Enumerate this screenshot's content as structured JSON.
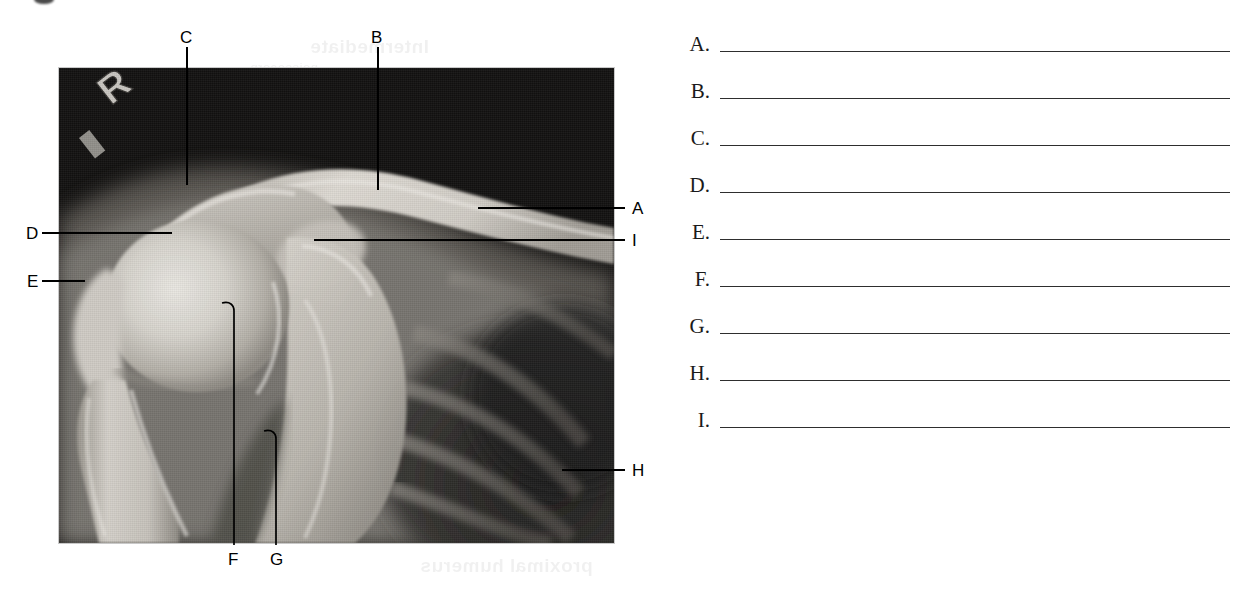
{
  "worksheet": {
    "type": "anatomy-labeling-exercise",
    "figure": {
      "kind": "radiograph",
      "region": "shoulder",
      "side_marker": "R",
      "marker_meaning": "right",
      "image_left": 59,
      "image_top": 68,
      "image_width": 555,
      "image_height": 475
    },
    "figure_labels": [
      {
        "letter": "A",
        "x": 632,
        "y": 208,
        "side": "right",
        "leader": {
          "type": "horizontal",
          "x1": 478,
          "y": 208,
          "x2": 625
        }
      },
      {
        "letter": "B",
        "x": 371,
        "y": 38,
        "side": "top",
        "leader": {
          "type": "vertical",
          "x": 377,
          "y1": 47,
          "y2": 190
        }
      },
      {
        "letter": "C",
        "x": 180,
        "y": 38,
        "side": "top",
        "leader": {
          "type": "vertical",
          "x": 186,
          "y1": 47,
          "y2": 185
        }
      },
      {
        "letter": "D",
        "x": 27,
        "y": 233,
        "side": "left",
        "leader": {
          "type": "horizontal",
          "x1": 42,
          "y": 233,
          "x2": 172
        }
      },
      {
        "letter": "E",
        "x": 27,
        "y": 281,
        "side": "left",
        "leader": {
          "type": "horizontal",
          "x1": 42,
          "y": 281,
          "x2": 85
        }
      },
      {
        "letter": "F",
        "x": 228,
        "y": 558,
        "side": "bottom",
        "leader": {
          "type": "vertical-hook",
          "x": 234,
          "y1": 303,
          "y2": 545
        }
      },
      {
        "letter": "G",
        "x": 270,
        "y": 558,
        "side": "bottom",
        "leader": {
          "type": "vertical-hook",
          "x": 276,
          "y1": 431,
          "y2": 545
        }
      },
      {
        "letter": "H",
        "x": 632,
        "y": 470,
        "side": "right",
        "leader": {
          "type": "horizontal",
          "x1": 562,
          "y": 470,
          "x2": 625
        }
      },
      {
        "letter": "I",
        "x": 632,
        "y": 240,
        "side": "right",
        "leader": {
          "type": "horizontal",
          "x1": 314,
          "y": 240,
          "x2": 625
        }
      }
    ],
    "answer_key": {
      "items": [
        {
          "letter": "A.",
          "answer": ""
        },
        {
          "letter": "B.",
          "answer": ""
        },
        {
          "letter": "C.",
          "answer": ""
        },
        {
          "letter": "D.",
          "answer": ""
        },
        {
          "letter": "E.",
          "answer": ""
        },
        {
          "letter": "F.",
          "answer": ""
        },
        {
          "letter": "G.",
          "answer": ""
        },
        {
          "letter": "H.",
          "answer": ""
        },
        {
          "letter": "I.",
          "answer": ""
        }
      ]
    },
    "bleed_through": {
      "top_heading": "Intermediate",
      "top_sub": "noissecorp",
      "bottom_text": "proximal humerus"
    },
    "colors": {
      "line": "#2e2e2e",
      "label_text": "#000000",
      "page_background": "#ffffff",
      "film_background": "#101010"
    }
  }
}
